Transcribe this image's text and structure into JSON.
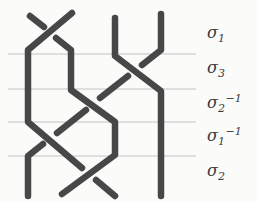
{
  "diagram": {
    "type": "braid-diagram",
    "num_strands": 4,
    "canvas": {
      "width": 258,
      "height": 202,
      "background": "#fbfbfa"
    },
    "strand_style": {
      "color": "#474747",
      "width": 6.5,
      "linecap": "round",
      "linejoin": "round"
    },
    "guide_style": {
      "color": "#c2c2c2",
      "width": 1
    },
    "guide_lines": {
      "x_start": 8,
      "x_end": 196,
      "y_positions": [
        54,
        89,
        122,
        156
      ]
    },
    "labels": {
      "color": "#3a3a3a",
      "x": 207,
      "main_size": 16,
      "script_size": 11,
      "items": [
        {
          "base": "σ",
          "sub": "1",
          "sup": "",
          "baseline_y": 38
        },
        {
          "base": "σ",
          "sub": "3",
          "sup": "",
          "baseline_y": 73
        },
        {
          "base": "σ",
          "sub": "2",
          "sup": "−1",
          "baseline_y": 108
        },
        {
          "base": "σ",
          "sub": "1",
          "sup": "−1",
          "baseline_y": 141
        },
        {
          "base": "σ",
          "sub": "2",
          "sup": "",
          "baseline_y": 176
        }
      ]
    },
    "strand_segments": [
      {
        "name": "strand4-under-top",
        "layer": "under",
        "points": [
          [
            161,
            14
          ],
          [
            161,
            50
          ],
          [
            142,
            65
          ]
        ]
      },
      {
        "name": "strand4-under-mid",
        "layer": "under",
        "points": [
          [
            128,
            76
          ],
          [
            100,
            98
          ]
        ]
      },
      {
        "name": "strand4-under-low",
        "layer": "under",
        "points": [
          [
            86,
            110
          ],
          [
            57,
            133
          ]
        ]
      },
      {
        "name": "strand4-under-bottom",
        "layer": "under",
        "points": [
          [
            43,
            144
          ],
          [
            28,
            156
          ],
          [
            28,
            196
          ]
        ]
      },
      {
        "name": "strand1-under-sigma1",
        "layer": "under",
        "points": [
          [
            30,
            16
          ],
          [
            44,
            27
          ]
        ]
      },
      {
        "name": "strand2-under-sigma2",
        "layer": "under",
        "points": [
          [
            96,
            180
          ],
          [
            115,
            196
          ]
        ]
      },
      {
        "name": "strand1-over-main",
        "layer": "over",
        "points": [
          [
            56,
            38
          ],
          [
            71,
            50
          ],
          [
            71,
            90
          ],
          [
            115,
            122
          ],
          [
            115,
            155
          ],
          [
            62,
            194
          ]
        ]
      },
      {
        "name": "strand2-over-main",
        "layer": "over",
        "points": [
          [
            72,
            13
          ],
          [
            28,
            50
          ],
          [
            28,
            122
          ],
          [
            82,
            168
          ]
        ]
      },
      {
        "name": "strand3-over-main",
        "layer": "over",
        "points": [
          [
            115,
            18
          ],
          [
            115,
            56
          ],
          [
            161,
            91
          ],
          [
            161,
            196
          ]
        ]
      }
    ]
  }
}
